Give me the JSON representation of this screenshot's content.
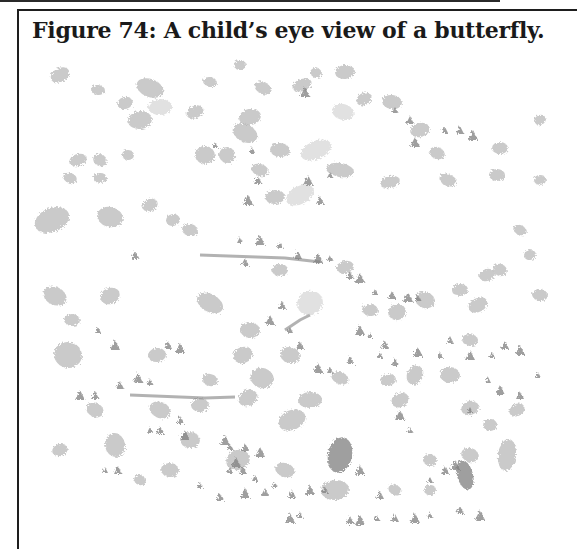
{
  "figure": {
    "number": 74,
    "caption": "Figure 74: A child’s eye view of a butterfly.",
    "image_description": "child-drawing-butterfly-blobs",
    "colors": {
      "border": "#1e1e1e",
      "caption_text": "#1a1a1a",
      "blob_light": "#c8c8c8",
      "blob_mid": "#a9a9a9",
      "blob_dark": "#7e7e7e",
      "background": "#ffffff"
    },
    "blobs": [
      [
        60,
        75,
        10,
        7,
        "m"
      ],
      [
        98,
        90,
        7,
        5,
        "m"
      ],
      [
        125,
        103,
        8,
        6,
        "m"
      ],
      [
        150,
        88,
        14,
        9,
        "m"
      ],
      [
        160,
        107,
        12,
        8,
        "l"
      ],
      [
        195,
        112,
        9,
        6,
        "m"
      ],
      [
        210,
        82,
        7,
        5,
        "m"
      ],
      [
        240,
        65,
        6,
        5,
        "m"
      ],
      [
        263,
        88,
        9,
        6,
        "m"
      ],
      [
        280,
        150,
        10,
        7,
        "m"
      ],
      [
        302,
        85,
        10,
        6,
        "m"
      ],
      [
        316,
        73,
        6,
        5,
        "m"
      ],
      [
        345,
        72,
        10,
        7,
        "m"
      ],
      [
        364,
        99,
        8,
        6,
        "m"
      ],
      [
        392,
        102,
        10,
        7,
        "m"
      ],
      [
        420,
        130,
        10,
        7,
        "m"
      ],
      [
        437,
        153,
        8,
        6,
        "m"
      ],
      [
        500,
        148,
        8,
        6,
        "m"
      ],
      [
        316,
        150,
        16,
        9,
        "l"
      ],
      [
        343,
        112,
        11,
        8,
        "l"
      ],
      [
        250,
        117,
        11,
        8,
        "m"
      ],
      [
        245,
        133,
        13,
        9,
        "m"
      ],
      [
        205,
        155,
        10,
        9,
        "m"
      ],
      [
        227,
        155,
        8,
        8,
        "m"
      ],
      [
        260,
        170,
        9,
        6,
        "m"
      ],
      [
        275,
        197,
        10,
        7,
        "m"
      ],
      [
        300,
        195,
        15,
        9,
        "l"
      ],
      [
        340,
        170,
        14,
        7,
        "m"
      ],
      [
        390,
        182,
        10,
        6,
        "m"
      ],
      [
        448,
        180,
        9,
        6,
        "m"
      ],
      [
        497,
        175,
        8,
        6,
        "m"
      ],
      [
        52,
        220,
        18,
        12,
        "m"
      ],
      [
        110,
        217,
        13,
        10,
        "m"
      ],
      [
        140,
        120,
        12,
        9,
        "m"
      ],
      [
        100,
        160,
        7,
        6,
        "m"
      ],
      [
        128,
        155,
        6,
        5,
        "m"
      ],
      [
        78,
        160,
        9,
        6,
        "m"
      ],
      [
        70,
        178,
        7,
        5,
        "m"
      ],
      [
        100,
        178,
        7,
        5,
        "m"
      ],
      [
        150,
        205,
        8,
        6,
        "m"
      ],
      [
        190,
        230,
        8,
        6,
        "m"
      ],
      [
        173,
        220,
        7,
        6,
        "m"
      ],
      [
        55,
        296,
        12,
        9,
        "m"
      ],
      [
        72,
        320,
        8,
        6,
        "m"
      ],
      [
        110,
        296,
        10,
        8,
        "m"
      ],
      [
        68,
        355,
        14,
        13,
        "m"
      ],
      [
        157,
        355,
        9,
        7,
        "m"
      ],
      [
        210,
        303,
        14,
        9,
        "m"
      ],
      [
        250,
        330,
        10,
        8,
        "m"
      ],
      [
        243,
        355,
        10,
        8,
        "m"
      ],
      [
        262,
        378,
        12,
        10,
        "m"
      ],
      [
        280,
        270,
        8,
        6,
        "m"
      ],
      [
        310,
        303,
        13,
        12,
        "l"
      ],
      [
        290,
        355,
        10,
        8,
        "m"
      ],
      [
        345,
        267,
        9,
        6,
        "m"
      ],
      [
        340,
        378,
        9,
        6,
        "m"
      ],
      [
        370,
        310,
        8,
        6,
        "m"
      ],
      [
        397,
        312,
        9,
        8,
        "m"
      ],
      [
        425,
        300,
        10,
        8,
        "m"
      ],
      [
        460,
        290,
        8,
        6,
        "m"
      ],
      [
        478,
        305,
        10,
        7,
        "m"
      ],
      [
        470,
        340,
        8,
        6,
        "m"
      ],
      [
        487,
        275,
        8,
        6,
        "m"
      ],
      [
        500,
        270,
        7,
        6,
        "m"
      ],
      [
        310,
        400,
        12,
        8,
        "m"
      ],
      [
        292,
        420,
        14,
        10,
        "m"
      ],
      [
        340,
        455,
        12,
        18,
        "d"
      ],
      [
        388,
        380,
        8,
        6,
        "m"
      ],
      [
        415,
        375,
        8,
        10,
        "m"
      ],
      [
        450,
        375,
        10,
        8,
        "m"
      ],
      [
        470,
        408,
        9,
        7,
        "m"
      ],
      [
        470,
        455,
        9,
        7,
        "m"
      ],
      [
        490,
        425,
        7,
        6,
        "m"
      ],
      [
        517,
        410,
        8,
        6,
        "m"
      ],
      [
        507,
        455,
        9,
        16,
        "m"
      ],
      [
        465,
        475,
        8,
        15,
        "d"
      ],
      [
        160,
        410,
        11,
        8,
        "m"
      ],
      [
        200,
        405,
        9,
        7,
        "m"
      ],
      [
        248,
        398,
        10,
        8,
        "m"
      ],
      [
        210,
        380,
        8,
        6,
        "m"
      ],
      [
        115,
        445,
        10,
        12,
        "m"
      ],
      [
        95,
        410,
        9,
        7,
        "m"
      ],
      [
        190,
        440,
        10,
        8,
        "m"
      ],
      [
        238,
        460,
        12,
        10,
        "m"
      ],
      [
        285,
        470,
        10,
        7,
        "m"
      ],
      [
        335,
        490,
        14,
        10,
        "m"
      ],
      [
        400,
        400,
        9,
        7,
        "m"
      ],
      [
        540,
        295,
        8,
        6,
        "m"
      ],
      [
        530,
        255,
        6,
        5,
        "m"
      ],
      [
        520,
        230,
        7,
        5,
        "m"
      ],
      [
        540,
        180,
        6,
        5,
        "m"
      ],
      [
        540,
        120,
        6,
        5,
        "m"
      ],
      [
        430,
        460,
        7,
        6,
        "m"
      ],
      [
        430,
        490,
        6,
        5,
        "m"
      ],
      [
        395,
        490,
        7,
        5,
        "m"
      ],
      [
        170,
        470,
        9,
        7,
        "m"
      ],
      [
        60,
        450,
        8,
        6,
        "m"
      ],
      [
        140,
        480,
        6,
        5,
        "m"
      ]
    ],
    "dark_marks": [
      [
        145,
        395,
        "M130,395 L205,398 L235,397"
      ],
      [
        340,
        290,
        "M200,255 L285,258 L320,262"
      ],
      [
        300,
        305,
        "M285,330 L300,320 L310,315"
      ]
    ],
    "small_dark_bits": [
      [
        252,
        150
      ],
      [
        258,
        180
      ],
      [
        248,
        200
      ],
      [
        240,
        240
      ],
      [
        245,
        262
      ],
      [
        260,
        240
      ],
      [
        280,
        245
      ],
      [
        298,
        255
      ],
      [
        318,
        258
      ],
      [
        330,
        258
      ],
      [
        350,
        275
      ],
      [
        360,
        278
      ],
      [
        375,
        292
      ],
      [
        392,
        295
      ],
      [
        408,
        297
      ],
      [
        418,
        298
      ],
      [
        282,
        305
      ],
      [
        270,
        320
      ],
      [
        290,
        330
      ],
      [
        300,
        345
      ],
      [
        318,
        368
      ],
      [
        330,
        370
      ],
      [
        350,
        360
      ],
      [
        360,
        330
      ],
      [
        380,
        355
      ],
      [
        395,
        362
      ],
      [
        418,
        352
      ],
      [
        440,
        355
      ],
      [
        450,
        340
      ],
      [
        470,
        355
      ],
      [
        492,
        355
      ],
      [
        505,
        345
      ],
      [
        520,
        350
      ],
      [
        538,
        375
      ],
      [
        520,
        395
      ],
      [
        500,
        390
      ],
      [
        488,
        380
      ],
      [
        180,
        420
      ],
      [
        185,
        435
      ],
      [
        150,
        430
      ],
      [
        160,
        430
      ],
      [
        225,
        440
      ],
      [
        230,
        447
      ],
      [
        245,
        447
      ],
      [
        260,
        452
      ],
      [
        230,
        470
      ],
      [
        243,
        470
      ],
      [
        236,
        462
      ],
      [
        275,
        485
      ],
      [
        292,
        494
      ],
      [
        310,
        490
      ],
      [
        325,
        490
      ],
      [
        350,
        520
      ],
      [
        360,
        520
      ],
      [
        377,
        518
      ],
      [
        395,
        518
      ],
      [
        415,
        518
      ],
      [
        430,
        515
      ],
      [
        460,
        510
      ],
      [
        480,
        515
      ],
      [
        430,
        480
      ],
      [
        445,
        470
      ],
      [
        455,
        465
      ],
      [
        470,
        410
      ],
      [
        380,
        495
      ],
      [
        360,
        470
      ],
      [
        200,
        485
      ],
      [
        220,
        497
      ],
      [
        245,
        493
      ],
      [
        255,
        478
      ],
      [
        265,
        492
      ],
      [
        290,
        518
      ],
      [
        300,
        515
      ],
      [
        120,
        385
      ],
      [
        138,
        378
      ],
      [
        150,
        382
      ],
      [
        95,
        395
      ],
      [
        80,
        395
      ],
      [
        105,
        470
      ],
      [
        118,
        470
      ],
      [
        305,
        92
      ],
      [
        395,
        110
      ],
      [
        410,
        120
      ],
      [
        415,
        142
      ],
      [
        215,
        145
      ],
      [
        135,
        255
      ],
      [
        115,
        345
      ],
      [
        98,
        330
      ],
      [
        168,
        345
      ],
      [
        180,
        348
      ],
      [
        330,
        175
      ],
      [
        320,
        200
      ],
      [
        308,
        180
      ],
      [
        445,
        130
      ],
      [
        460,
        130
      ],
      [
        473,
        135
      ],
      [
        370,
        335
      ],
      [
        385,
        345
      ],
      [
        400,
        415
      ],
      [
        410,
        430
      ]
    ]
  }
}
